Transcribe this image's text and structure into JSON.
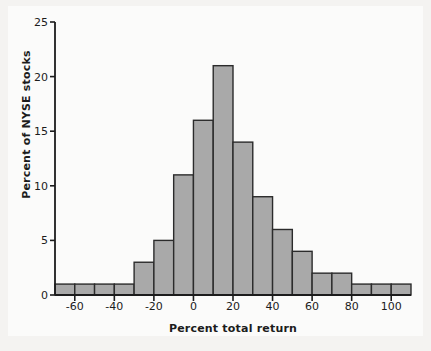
{
  "chart_data": {
    "type": "bar",
    "title": "",
    "subtitle": "",
    "xlabel": "Percent total return",
    "ylabel": "Percent of NYSE stocks",
    "bin_width": 10,
    "xlim": [
      -70,
      110
    ],
    "ylim": [
      0,
      25
    ],
    "grid": false,
    "legend": null,
    "bar_fill": "#a9a9a9",
    "bar_edge": "#2b2b2b",
    "axis_color": "#1c1c1c",
    "background": "#fbfbfa",
    "x_ticks": [
      -60,
      -40,
      -20,
      0,
      20,
      40,
      60,
      80,
      100
    ],
    "x_tick_labels": [
      "-60",
      "-40",
      "-20",
      "0",
      "20",
      "40",
      "60",
      "80",
      "100"
    ],
    "y_ticks": [
      0,
      5,
      10,
      15,
      20,
      25
    ],
    "y_tick_labels": [
      "0",
      "5",
      "10",
      "15",
      "20",
      "25"
    ],
    "bins": [
      {
        "start": -70,
        "end": -60,
        "value": 1
      },
      {
        "start": -60,
        "end": -50,
        "value": 1
      },
      {
        "start": -50,
        "end": -40,
        "value": 1
      },
      {
        "start": -40,
        "end": -30,
        "value": 1
      },
      {
        "start": -30,
        "end": -20,
        "value": 3
      },
      {
        "start": -20,
        "end": -10,
        "value": 5
      },
      {
        "start": -10,
        "end": 0,
        "value": 11
      },
      {
        "start": 0,
        "end": 10,
        "value": 16
      },
      {
        "start": 10,
        "end": 20,
        "value": 21
      },
      {
        "start": 20,
        "end": 30,
        "value": 14
      },
      {
        "start": 30,
        "end": 40,
        "value": 9
      },
      {
        "start": 40,
        "end": 50,
        "value": 6
      },
      {
        "start": 50,
        "end": 60,
        "value": 4
      },
      {
        "start": 60,
        "end": 70,
        "value": 2
      },
      {
        "start": 70,
        "end": 80,
        "value": 2
      },
      {
        "start": 80,
        "end": 90,
        "value": 1
      },
      {
        "start": 90,
        "end": 100,
        "value": 1
      },
      {
        "start": 100,
        "end": 110,
        "value": 1
      }
    ],
    "categories": [
      "-70 to -60",
      "-60 to -50",
      "-50 to -40",
      "-40 to -30",
      "-30 to -20",
      "-20 to -10",
      "-10 to 0",
      "0 to 10",
      "10 to 20",
      "20 to 30",
      "30 to 40",
      "40 to 50",
      "50 to 60",
      "60 to 70",
      "70 to 80",
      "80 to 90",
      "90 to 100",
      "100 to 110"
    ],
    "values": [
      1,
      1,
      1,
      1,
      3,
      5,
      11,
      16,
      21,
      14,
      9,
      6,
      4,
      2,
      2,
      1,
      1,
      1
    ]
  }
}
